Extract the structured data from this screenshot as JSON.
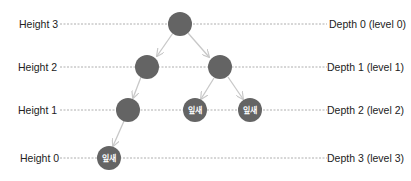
{
  "colors": {
    "node_fill": "#646464",
    "edge": "#c8c8c8",
    "guide": "#9a9a9a",
    "label": "#222222",
    "node_text": "#ffffff"
  },
  "rows": [
    {
      "height_label": "Height 3",
      "depth_label": "Depth 0 (level 0)",
      "y": 24
    },
    {
      "height_label": "Height 2",
      "depth_label": "Depth 1 (level 1)",
      "y": 67
    },
    {
      "height_label": "Height 1",
      "depth_label": "Depth 2 (level 2)",
      "y": 110
    },
    {
      "height_label": "Height 0",
      "depth_label": "Depth 3 (level 3)",
      "y": 158
    }
  ],
  "nodes": [
    {
      "id": "root",
      "x": 180,
      "y": 24,
      "label": ""
    },
    {
      "id": "l1-left",
      "x": 147,
      "y": 67,
      "label": ""
    },
    {
      "id": "l1-right",
      "x": 220,
      "y": 67,
      "label": ""
    },
    {
      "id": "l2-a",
      "x": 128,
      "y": 110,
      "label": ""
    },
    {
      "id": "l2-b",
      "x": 195,
      "y": 110,
      "label": "잎새"
    },
    {
      "id": "l2-c",
      "x": 250,
      "y": 110,
      "label": "잎새"
    },
    {
      "id": "l3-a",
      "x": 109,
      "y": 158,
      "label": "잎새"
    }
  ],
  "edges": [
    {
      "from": "root",
      "to": "l1-left"
    },
    {
      "from": "root",
      "to": "l1-right"
    },
    {
      "from": "l1-left",
      "to": "l2-a"
    },
    {
      "from": "l1-right",
      "to": "l2-b"
    },
    {
      "from": "l1-right",
      "to": "l2-c"
    },
    {
      "from": "l2-a",
      "to": "l3-a"
    }
  ],
  "labels": {
    "height_3": "Height 3",
    "height_2": "Height 2",
    "height_1": "Height 1",
    "height_0": "Height 0",
    "depth_0": "Depth 0 (level 0)",
    "depth_1": "Depth 1 (level 1)",
    "depth_2": "Depth 2 (level 2)",
    "depth_3": "Depth 3 (level 3)",
    "leaf": "잎새"
  }
}
